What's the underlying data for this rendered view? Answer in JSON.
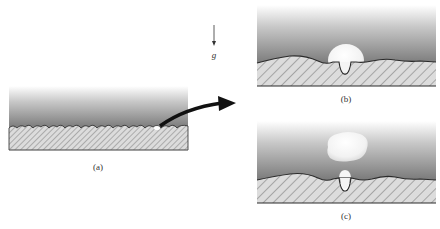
{
  "figure": {
    "panels": [
      {
        "id": "a",
        "label": "(a)",
        "description": "Rough heated surface with small vapor nucleus trapped in cavity"
      },
      {
        "id": "b",
        "label": "(b)",
        "description": "Vapor bubble growing from surface cavity"
      },
      {
        "id": "c",
        "label": "(c)",
        "description": "Bubble departs; residual vapor remains in cavity"
      }
    ],
    "gravity_label": "g",
    "colors": {
      "liquid_top": "#ffffff",
      "liquid_bottom": "#7a7a7a",
      "solid_fill": "#d9d9d9",
      "hatch": "#6e6e6e",
      "outline": "#2a2a2a",
      "vapor": "#f8f8f8",
      "arrow": "#111111"
    }
  }
}
